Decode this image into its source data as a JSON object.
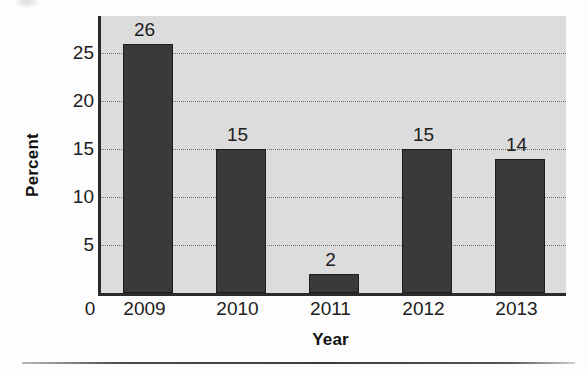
{
  "figure": {
    "background_color": "#fdfdfd",
    "plot_background_color": "#dcdcdc",
    "axis_color": "#2b2b2b",
    "bar_color": "#3a3a3a",
    "gridline_color": "#6e6e6e"
  },
  "chart_data": {
    "type": "bar",
    "title": "",
    "subtitle": "",
    "categories": [
      "2009",
      "2010",
      "2011",
      "2012",
      "2013"
    ],
    "values": [
      26,
      15,
      2,
      15,
      14
    ],
    "data_labels": [
      "26",
      "15",
      "2",
      "15",
      "14"
    ],
    "xlabel": "Year",
    "ylabel": "Percent",
    "ylim": [
      0,
      28.9
    ],
    "ytick_values": [
      5,
      10,
      15,
      20,
      25
    ],
    "ytick_labels": [
      "5",
      "10",
      "15",
      "20",
      "25"
    ],
    "origin_label": "0",
    "grid": true,
    "grid_axis": "y",
    "grid_style": "dotted",
    "legend": false,
    "legend_position": "none",
    "series": [
      {
        "name": "Percent",
        "values": [
          26,
          15,
          2,
          15,
          14
        ],
        "color": "#3a3a3a"
      }
    ],
    "annotations": []
  }
}
